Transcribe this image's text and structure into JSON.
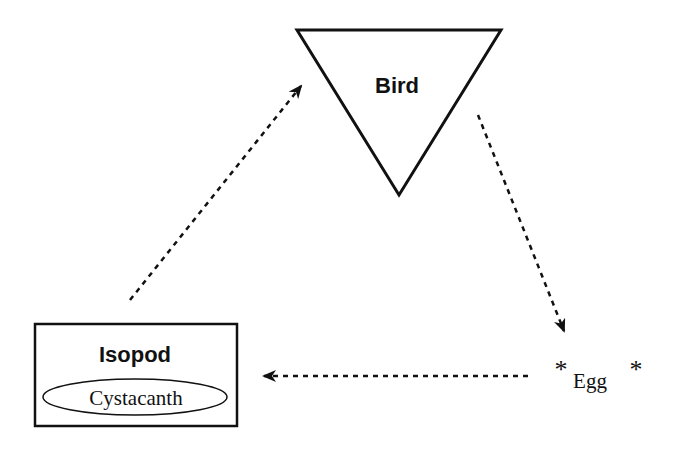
{
  "diagram": {
    "type": "life-cycle",
    "nodes": {
      "bird": {
        "label": "Bird",
        "shape": "inverted-triangle"
      },
      "isopod": {
        "label": "Isopod",
        "shape": "rectangle",
        "inner": {
          "label": "Cystacanth",
          "shape": "ellipse"
        }
      },
      "egg": {
        "label": "Egg",
        "star_left": "*",
        "star_right": "*"
      }
    },
    "edges": [
      {
        "from": "Isopod",
        "to": "Bird",
        "style": "dashed-arrow"
      },
      {
        "from": "Bird",
        "to": "Egg",
        "style": "dashed-arrow"
      },
      {
        "from": "Egg",
        "to": "Isopod",
        "style": "dashed-arrow"
      }
    ],
    "colors": {
      "stroke": "#111111",
      "background": "#ffffff"
    }
  }
}
